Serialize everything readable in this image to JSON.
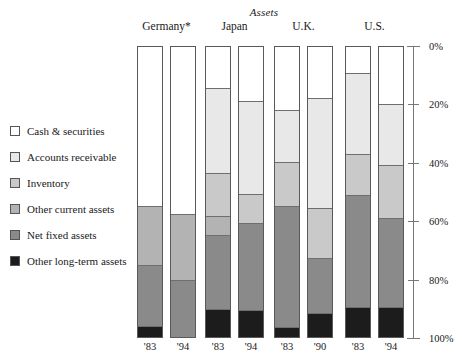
{
  "chart_data": {
    "type": "bar",
    "subtype": "stacked-bar-100-percent",
    "title": "Assets",
    "xlabel": "",
    "ylabel": "",
    "ylim": [
      0,
      100
    ],
    "y_axis_inverted": true,
    "ytick_labels": [
      "0%",
      "20%",
      "40%",
      "60%",
      "80%",
      "100%"
    ],
    "ytick_values": [
      0,
      20,
      40,
      60,
      80,
      100
    ],
    "grid": false,
    "legend_position": "left",
    "groups": [
      "Germany*",
      "Japan",
      "U.K.",
      "U.S."
    ],
    "categories": [
      "'83",
      "'94",
      "'83",
      "'94",
      "'83",
      "'90",
      "'83",
      "'94"
    ],
    "bars": [
      {
        "group": "Germany*",
        "year": "'83"
      },
      {
        "group": "Germany*",
        "year": "'94"
      },
      {
        "group": "Japan",
        "year": "'83"
      },
      {
        "group": "Japan",
        "year": "'94"
      },
      {
        "group": "U.K.",
        "year": "'83"
      },
      {
        "group": "U.K.",
        "year": "'90"
      },
      {
        "group": "U.S.",
        "year": "'83"
      },
      {
        "group": "U.S.",
        "year": "'94"
      }
    ],
    "series": [
      {
        "name": "Cash & securities",
        "color": "#ffffff",
        "values": [
          55.5,
          58.0,
          14.5,
          19.0,
          22.0,
          18.0,
          9.0,
          20.0
        ]
      },
      {
        "name": "Accounts receivable",
        "color": "#e8e8e8",
        "values": [
          0.0,
          0.0,
          29.5,
          32.0,
          18.0,
          38.0,
          28.0,
          21.0
        ]
      },
      {
        "name": "Inventory",
        "color": "#c9c9c9",
        "values": [
          0.0,
          0.0,
          14.5,
          10.0,
          15.0,
          17.0,
          14.0,
          18.0
        ]
      },
      {
        "name": "Other current assets",
        "color": "#b3b3b3",
        "values": [
          20.0,
          22.5,
          6.5,
          0.0,
          0.0,
          0.0,
          0.0,
          0.0
        ]
      },
      {
        "name": "Net fixed assets",
        "color": "#8a8a8a",
        "values": [
          21.0,
          19.5,
          25.5,
          30.0,
          42.0,
          19.0,
          39.0,
          31.0
        ]
      },
      {
        "name": "Other long-term assets",
        "color": "#1c1c1c",
        "values": [
          3.5,
          0.0,
          9.5,
          9.0,
          3.0,
          8.0,
          10.0,
          10.0
        ]
      }
    ],
    "legend": [
      {
        "label": "Cash & securities",
        "color": "#ffffff"
      },
      {
        "label": "Accounts receivable",
        "color": "#e8e8e8"
      },
      {
        "label": "Inventory",
        "color": "#c9c9c9"
      },
      {
        "label": "Other current assets",
        "color": "#b3b3b3"
      },
      {
        "label": "Net fixed assets",
        "color": "#8a8a8a"
      },
      {
        "label": "Other long-term assets",
        "color": "#1c1c1c"
      }
    ]
  }
}
